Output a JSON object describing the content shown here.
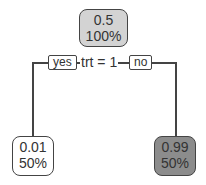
{
  "tree": {
    "root": {
      "value": "0.5",
      "percent": "100%",
      "fill": "#d3d3d3"
    },
    "split": {
      "label": "trt = 1",
      "yes_label": "yes",
      "no_label": "no"
    },
    "left": {
      "value": "0.01",
      "percent": "50%",
      "fill": "#ffffff"
    },
    "right": {
      "value": "0.99",
      "percent": "50%",
      "fill": "#8c8c8c"
    }
  }
}
